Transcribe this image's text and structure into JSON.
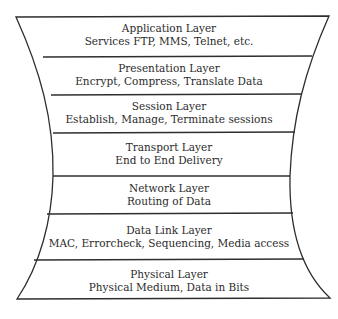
{
  "diagram": {
    "colors": {
      "stroke": "#2e2e2e",
      "text": "#2b2b2b",
      "background": "#ffffff"
    },
    "layers": [
      {
        "name": "Application Layer",
        "description": "Services FTP, MMS, Telnet, etc."
      },
      {
        "name": "Presentation Layer",
        "description": "Encrypt, Compress, Translate Data"
      },
      {
        "name": "Session Layer",
        "description": "Establish, Manage, Terminate sessions"
      },
      {
        "name": "Transport Layer",
        "description": "End to End Delivery"
      },
      {
        "name": "Network Layer",
        "description": "Routing of Data"
      },
      {
        "name": "Data Link Layer",
        "description": "MAC, Errorcheck, Sequencing, Media access"
      },
      {
        "name": "Physical Layer",
        "description": "Physical Medium, Data in Bits"
      }
    ]
  }
}
